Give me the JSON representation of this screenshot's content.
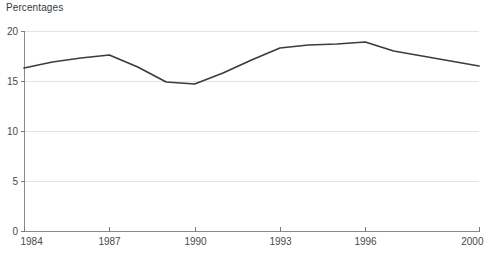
{
  "chart_data": {
    "type": "line",
    "title": "Percentages",
    "xlabel": "",
    "ylabel": "",
    "x": [
      1984,
      1985,
      1986,
      1987,
      1988,
      1989,
      1990,
      1991,
      1992,
      1993,
      1994,
      1995,
      1996,
      1997,
      1998,
      1999,
      2000
    ],
    "categories": [
      "1984",
      "1985",
      "1986",
      "1987",
      "1988",
      "1989",
      "1990",
      "1991",
      "1992",
      "1993",
      "1994",
      "1995",
      "1996",
      "1997",
      "1998",
      "1999",
      "2000"
    ],
    "values": [
      16.3,
      16.9,
      17.3,
      17.6,
      16.4,
      14.9,
      14.7,
      15.8,
      17.1,
      18.3,
      18.6,
      18.7,
      18.9,
      18.0,
      17.5,
      17.0,
      16.5
    ],
    "series": [
      {
        "name": "Percentages",
        "color": "#3c3c3c",
        "values": [
          16.3,
          16.9,
          17.3,
          17.6,
          16.4,
          14.9,
          14.7,
          15.8,
          17.1,
          18.3,
          18.6,
          18.7,
          18.9,
          18.0,
          17.5,
          17.0,
          16.5
        ]
      }
    ],
    "xlim": [
      1984,
      2000
    ],
    "ylim": [
      0,
      20
    ],
    "y_ticks": [
      0,
      5,
      10,
      15,
      20
    ],
    "y_tick_labels": [
      "0",
      "5",
      "10",
      "15",
      "20"
    ],
    "x_ticks": [
      1984,
      1987,
      1990,
      1993,
      1996,
      2000
    ],
    "x_tick_labels": [
      "1984",
      "1987",
      "1990",
      "1993",
      "1996",
      "2000"
    ],
    "grid": true,
    "grid_axis": "y",
    "legend": false,
    "legend_position": "none",
    "colors": {
      "line": "#3c3c3c",
      "grid": "#e3e3e3",
      "axis": "#8a8a8a",
      "text": "#4a4a4a",
      "background": "#ffffff"
    }
  }
}
